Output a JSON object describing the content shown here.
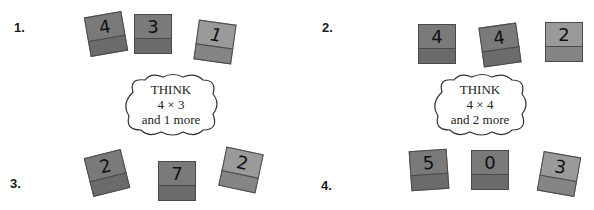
{
  "problems": [
    {
      "label": "1.",
      "blocks": [
        "4",
        "3",
        "1"
      ]
    },
    {
      "label": "2.",
      "blocks": [
        "4",
        "4",
        "2"
      ]
    },
    {
      "label": "3.",
      "blocks": [
        "2",
        "7",
        "2"
      ]
    },
    {
      "label": "4.",
      "blocks": [
        "5",
        "0",
        "3"
      ]
    }
  ],
  "hints": [
    {
      "line1": "THINK",
      "line2": "4 × 3",
      "line3": "and 1 more"
    },
    {
      "line1": "THINK",
      "line2": "4 × 4",
      "line3": "and 2 more"
    }
  ],
  "colors": {
    "block_dark": "#6b6b6b",
    "block_light": "#9a9a9a"
  }
}
